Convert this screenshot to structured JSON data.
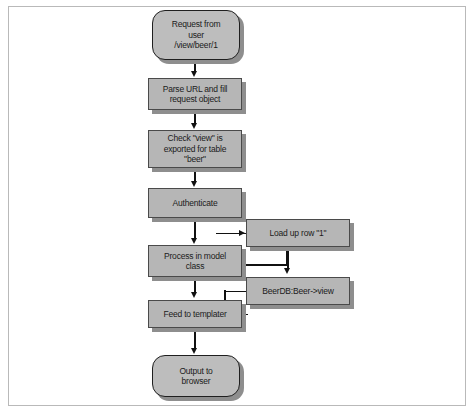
{
  "diagram": {
    "background_color": "#ffffff",
    "frame_color": "#b9b9b9",
    "node_fill_color": "#b6b6b6",
    "node_border_color": "#4a4a4a",
    "shadow_color": "#8e8e8e",
    "connector_color": "#111111",
    "nodes": [
      {
        "id": "request",
        "shape": "terminator",
        "label": "Request from\nuser\n/view/beer/1"
      },
      {
        "id": "parse",
        "shape": "process",
        "label": "Parse URL and fill\nrequest object"
      },
      {
        "id": "check",
        "shape": "process",
        "label": "Check \"view\" is\nexported for table\n\"beer\""
      },
      {
        "id": "authenticate",
        "shape": "process",
        "label": "Authenticate"
      },
      {
        "id": "model",
        "shape": "process",
        "label": "Process in model\nclass"
      },
      {
        "id": "loadrow",
        "shape": "process",
        "label": "Load up row \"1\""
      },
      {
        "id": "beerdb",
        "shape": "process",
        "label": "BeerDB:Beer->view"
      },
      {
        "id": "templater",
        "shape": "process",
        "label": "Feed to templater"
      },
      {
        "id": "output",
        "shape": "terminator",
        "label": "Output to\nbrowser"
      }
    ],
    "edges": [
      {
        "from": "request",
        "to": "parse",
        "direction": "down"
      },
      {
        "from": "parse",
        "to": "check",
        "direction": "down"
      },
      {
        "from": "check",
        "to": "authenticate",
        "direction": "down"
      },
      {
        "from": "authenticate",
        "to": "model",
        "direction": "down"
      },
      {
        "from": "model",
        "to": "loadrow",
        "direction": "right"
      },
      {
        "from": "loadrow",
        "to": "beerdb",
        "direction": "down"
      },
      {
        "from": "beerdb",
        "to": "templater",
        "direction": "left"
      },
      {
        "from": "model",
        "to": "templater",
        "direction": "down"
      },
      {
        "from": "templater",
        "to": "output",
        "direction": "down"
      }
    ]
  }
}
